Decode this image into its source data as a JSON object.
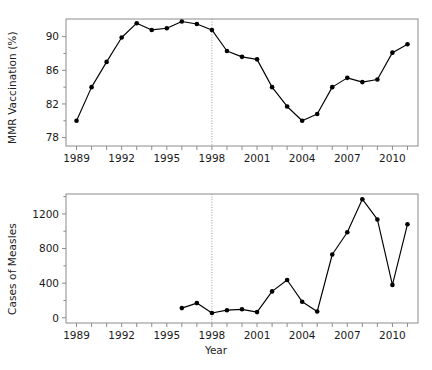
{
  "figure": {
    "xlabel": "Year",
    "panels": [
      "mmr-vaccination",
      "cases-of-measles"
    ]
  },
  "chart_data": [
    {
      "type": "line",
      "title": "",
      "xlabel": "",
      "ylabel": "MMR Vaccination (%)",
      "xlim": [
        1988.3,
        1911.7
      ],
      "x_range": [
        1988.3,
        2011.7
      ],
      "ylim": [
        77.0,
        92.1
      ],
      "grid": false,
      "legend": "none",
      "x_ticks_major": [
        1989,
        1992,
        1995,
        1998,
        2001,
        2004,
        2007,
        2010
      ],
      "x_ticks_all": [
        1989,
        1990,
        1991,
        1992,
        1993,
        1994,
        1995,
        1996,
        1997,
        1998,
        1999,
        2000,
        2001,
        2002,
        2003,
        2004,
        2005,
        2006,
        2007,
        2008,
        2009,
        2010,
        2011
      ],
      "y_ticks_major": [
        78,
        82,
        86,
        90
      ],
      "y_ticks_minor": [
        80,
        84,
        88
      ],
      "annotations": [
        {
          "type": "vline",
          "x": 1998,
          "style": "dotted",
          "label": "1998"
        }
      ],
      "x": [
        1989,
        1990,
        1991,
        1992,
        1993,
        1994,
        1995,
        1996,
        1997,
        1998,
        1999,
        2000,
        2001,
        2002,
        2003,
        2004,
        2005,
        2006,
        2007,
        2008,
        2009,
        2010,
        2011
      ],
      "values": [
        80.0,
        84.0,
        87.0,
        89.9,
        91.6,
        90.8,
        91.0,
        91.8,
        91.5,
        90.8,
        88.3,
        87.6,
        87.3,
        84.0,
        81.7,
        80.0,
        80.8,
        84.0,
        85.1,
        84.6,
        84.9,
        88.1,
        89.1
      ],
      "marker": "filled-circle",
      "color": "#000000"
    },
    {
      "type": "line",
      "title": "",
      "xlabel": "Year",
      "ylabel": "Cases of Measles",
      "xlim": [
        1988.3,
        2011.7
      ],
      "x_range": [
        1988.3,
        2011.7
      ],
      "ylim": [
        -60,
        1430
      ],
      "grid": false,
      "legend": "none",
      "x_ticks_major": [
        1989,
        1992,
        1995,
        1998,
        2001,
        2004,
        2007,
        2010
      ],
      "x_ticks_all": [
        1989,
        1990,
        1991,
        1992,
        1993,
        1994,
        1995,
        1996,
        1997,
        1998,
        1999,
        2000,
        2001,
        2002,
        2003,
        2004,
        2005,
        2006,
        2007,
        2008,
        2009,
        2010,
        2011
      ],
      "y_ticks_major": [
        0,
        400,
        800,
        1200
      ],
      "y_ticks_minor": [
        200,
        600,
        1000,
        1400
      ],
      "annotations": [
        {
          "type": "vline",
          "x": 1998,
          "style": "dotted",
          "label": "1998"
        }
      ],
      "x": [
        1996,
        1997,
        1998,
        1999,
        2000,
        2001,
        2002,
        2003,
        2004,
        2005,
        2006,
        2007,
        2008,
        2009,
        2010,
        2011
      ],
      "values": [
        112,
        170,
        55,
        88,
        98,
        66,
        305,
        437,
        186,
        73,
        731,
        988,
        1370,
        1136,
        380,
        1080
      ],
      "marker": "filled-circle",
      "color": "#000000"
    }
  ],
  "style": {
    "axis_color": "#8c8c8c",
    "line_color": "#000000",
    "marker_color": "#000000",
    "vline_color": "#999999",
    "background": "#ffffff",
    "text_color": "#1a1a1a"
  }
}
